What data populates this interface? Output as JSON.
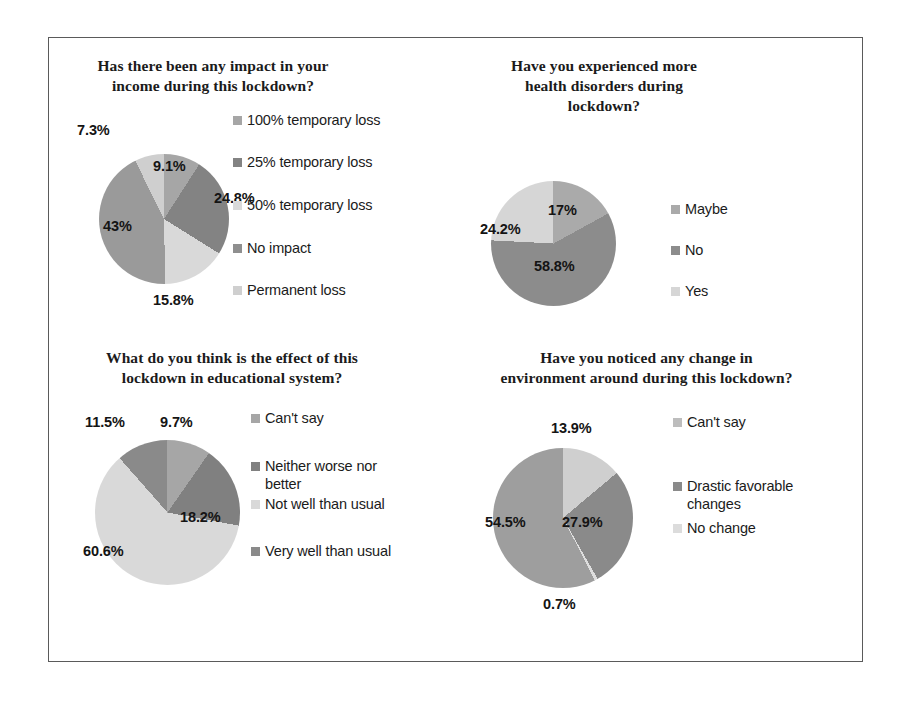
{
  "figure": {
    "frame_color": "#5a5a5a",
    "background": "#ffffff"
  },
  "palette": {
    "slice_a": "#a6a6a6",
    "slice_b": "#808080",
    "slice_c": "#d9d9d9",
    "slice_d": "#9b9b9b",
    "slice_e": "#c9c9c9",
    "text": "#1b1b1b"
  },
  "charts": [
    {
      "id": "income-impact",
      "title": "Has there been any impact in your\nincome during this lockdown?",
      "type": "pie",
      "categories": [
        "100% temporary loss",
        "25% temporary loss",
        "50% temporary loss",
        "No impact",
        "Permanent loss"
      ],
      "values": [
        9.1,
        24.8,
        15.8,
        43,
        7.3
      ],
      "labels": [
        "9.1%",
        "24.8%",
        "15.8%",
        "43%",
        "7.3%"
      ],
      "colors": [
        "#a6a6a6",
        "#838383",
        "#d9d9d9",
        "#9a9a9a",
        "#cfcfcf"
      ],
      "legend": [
        {
          "label": "100% temporary loss",
          "color": "#a6a6a6"
        },
        {
          "label": "25% temporary loss",
          "color": "#838383"
        },
        {
          "label": "50% temporary loss",
          "color": "#d9d9d9"
        },
        {
          "label": "No impact",
          "color": "#8f8f8f"
        },
        {
          "label": "Permanent loss",
          "color": "#cfcfcf"
        }
      ],
      "legend_position": "right"
    },
    {
      "id": "health-disorders",
      "title": "Have you experienced more\nhealth disorders during\nlockdown?",
      "type": "pie",
      "categories": [
        "Maybe",
        "No",
        "Yes"
      ],
      "values": [
        17,
        58.8,
        24.2
      ],
      "labels": [
        "17%",
        "58.8%",
        "24.2%"
      ],
      "colors": [
        "#aaaaaa",
        "#8c8c8c",
        "#d6d6d6"
      ],
      "legend": [
        {
          "label": "Maybe",
          "color": "#aaaaaa"
        },
        {
          "label": "No",
          "color": "#8c8c8c"
        },
        {
          "label": "Yes",
          "color": "#d6d6d6"
        }
      ],
      "legend_position": "right"
    },
    {
      "id": "education-effect",
      "title": "What do you think is the effect of this\nlockdown in educational system?",
      "type": "pie",
      "categories": [
        "Can't say",
        "Neither worse nor better",
        "Not well than usual",
        "Very well than usual"
      ],
      "values": [
        9.7,
        18.2,
        60.6,
        11.5
      ],
      "labels": [
        "9.7%",
        "18.2%",
        "60.6%",
        "11.5%"
      ],
      "colors": [
        "#a6a6a6",
        "#808080",
        "#d9d9d9",
        "#8a8a8a"
      ],
      "legend": [
        {
          "label": "Can't say",
          "color": "#a6a6a6"
        },
        {
          "label": "Neither worse nor\nbetter",
          "color": "#808080"
        },
        {
          "label": "Not well than usual",
          "color": "#d9d9d9"
        },
        {
          "label": "Very well than usual",
          "color": "#8a8a8a"
        }
      ],
      "legend_position": "right"
    },
    {
      "id": "environment-change",
      "title": "Have you noticed any change in\nenvironment around during this lockdown?",
      "type": "pie",
      "categories": [
        "Can't say",
        "Drastic favorable changes",
        "No change",
        "Drastic favorable changes"
      ],
      "values": [
        13.9,
        27.9,
        0.7,
        54.5
      ],
      "labels": [
        "13.9%",
        "27.9%",
        "0.7%",
        "54.5%"
      ],
      "colors": [
        "#cfcfcf",
        "#8a8a8a",
        "#dedede",
        "#9e9e9e"
      ],
      "legend": [
        {
          "label": "Can't say",
          "color": "#bdbdbd"
        },
        {
          "label": "Drastic favorable\nchanges",
          "color": "#8a8a8a"
        },
        {
          "label": "No change",
          "color": "#dcdcdc"
        }
      ],
      "legend_position": "right"
    }
  ]
}
